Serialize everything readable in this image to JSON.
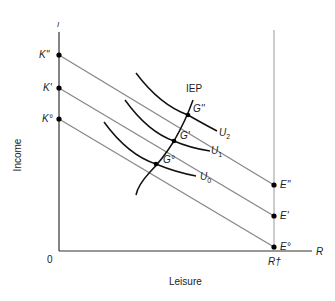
{
  "axes": {
    "y_axis_symbol": "I",
    "x_axis_symbol": "R",
    "origin_label": "0",
    "y_label": "Income",
    "x_label": "Leisure",
    "r_max_label": "R†"
  },
  "budget_lines": [
    {
      "start_label": "K''",
      "end_label": "E''"
    },
    {
      "start_label": "K'",
      "end_label": "E'"
    },
    {
      "start_label": "K°",
      "end_label": "E°"
    }
  ],
  "indifference_curves": [
    {
      "label": "U",
      "sub": "2"
    },
    {
      "label": "U",
      "sub": "1"
    },
    {
      "label": "U",
      "sub": "0"
    }
  ],
  "tangency_points": [
    {
      "label": "G''"
    },
    {
      "label": "G'"
    },
    {
      "label": "G°"
    }
  ],
  "expansion_path": {
    "label": "IEP"
  },
  "colors": {
    "axis": "#333333",
    "budget_line": "#888888",
    "curve": "#111111",
    "vertical_line": "#999999"
  }
}
